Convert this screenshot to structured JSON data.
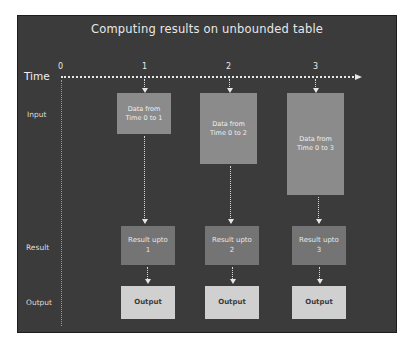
{
  "title": "Computing results on unbounded table",
  "axis": {
    "label": "Time",
    "ticks": [
      "0",
      "1",
      "2",
      "3"
    ]
  },
  "rows": {
    "input": "Input",
    "result": "Result",
    "output": "Output"
  },
  "columns": [
    {
      "input_line1": "Data from",
      "input_line2": "Time 0 to 1",
      "result_line1": "Result upto",
      "result_line2": "1",
      "output": "Output"
    },
    {
      "input_line1": "Data from",
      "input_line2": "Time 0 to 2",
      "result_line1": "Result upto",
      "result_line2": "2",
      "output": "Output"
    },
    {
      "input_line1": "Data from",
      "input_line2": "Time 0 to 3",
      "result_line1": "Result upto",
      "result_line2": "3",
      "output": "Output"
    }
  ],
  "colors": {
    "background": "#3b3b3b",
    "input_box": "#8b8b8b",
    "result_box": "#747474",
    "output_box": "#d0d0d0",
    "line": "#e6e6e6"
  }
}
